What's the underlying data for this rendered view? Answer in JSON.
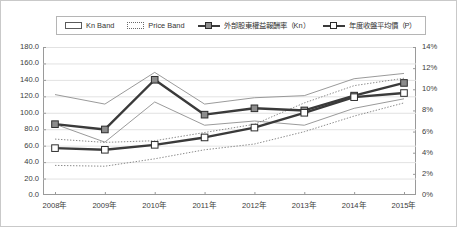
{
  "chart_data": {
    "type": "line",
    "title": "",
    "xlabel": "",
    "ylabel": "",
    "grid": true,
    "legend_position": "top",
    "categories": [
      "2008年",
      "2009年",
      "2010年",
      "2011年",
      "2012年",
      "2013年",
      "2014年",
      "2015年"
    ],
    "axes": {
      "left": {
        "label": "",
        "ylim": [
          0,
          180
        ],
        "step": 20,
        "ticks": [
          "0.0",
          "20.0",
          "40.0",
          "60.0",
          "80.0",
          "100.0",
          "120.0",
          "140.0",
          "160.0",
          "180.0"
        ],
        "tick_values": [
          0,
          20,
          40,
          60,
          80,
          100,
          120,
          140,
          160,
          180
        ]
      },
      "right": {
        "label": "",
        "ylim": [
          0,
          14
        ],
        "step": 2,
        "ticks": [
          "0%",
          "2%",
          "4%",
          "6%",
          "8%",
          "10%",
          "12%",
          "14%"
        ],
        "tick_values": [
          0,
          2,
          4,
          6,
          8,
          10,
          12,
          14
        ]
      }
    },
    "series": [
      {
        "name": "Kn Band",
        "kind": "band",
        "style": "solid-thin",
        "axis": "right",
        "color": "#8f8f8f",
        "upper": [
          9.5,
          8.6,
          11.6,
          8.6,
          9.2,
          9.4,
          11.0,
          11.5
        ],
        "lower": [
          6.7,
          5.0,
          8.8,
          6.6,
          7.0,
          6.6,
          8.2,
          9.1
        ]
      },
      {
        "name": "Price Band",
        "kind": "band",
        "style": "dotted-thin",
        "axis": "left",
        "color": "#7d7d7d",
        "upper": [
          68.0,
          64.0,
          66.0,
          76.0,
          86.0,
          112.0,
          133.0,
          142.0
        ],
        "lower": [
          36.0,
          35.0,
          44.0,
          55.0,
          62.0,
          77.0,
          96.0,
          112.0
        ]
      },
      {
        "name": "外部股東權益報酬率（Kn）",
        "kind": "line",
        "style": "thick-marker-filled",
        "axis": "right",
        "color": "#3a3a3a",
        "marker_fill": "#8c8c8c",
        "values": [
          6.7,
          6.2,
          10.9,
          7.6,
          8.2,
          8.0,
          9.4,
          10.6
        ]
      },
      {
        "name": "年度收盤平均價（P）",
        "kind": "line",
        "style": "thick-marker-hollow",
        "axis": "left",
        "color": "#3a3a3a",
        "marker_fill": "#ffffff",
        "values": [
          57.0,
          55.0,
          61.0,
          70.0,
          82.0,
          100.0,
          119.0,
          124.0
        ]
      }
    ],
    "annotations": [
      {
        "text": "12%",
        "x_index": 7,
        "axis": "right",
        "value": 8.6
      }
    ]
  },
  "legend": {
    "items": [
      {
        "label": "Kn Band",
        "key": "band-solid-key"
      },
      {
        "label": "Price Band",
        "key": "band-dotted-key"
      },
      {
        "label": "外部股東權益報酬率（Kn）",
        "key": "line-filled-key"
      },
      {
        "label": "年度收盤平均價（P）",
        "key": "line-hollow-key"
      }
    ]
  },
  "colors": {
    "frame": "#9a9a9a",
    "grid": "#e2e2e2",
    "series_dark": "#3a3a3a",
    "band": "#8f8f8f",
    "marker_fill": "#8c8c8c",
    "text": "#3b3b3b",
    "background": "#ffffff"
  }
}
